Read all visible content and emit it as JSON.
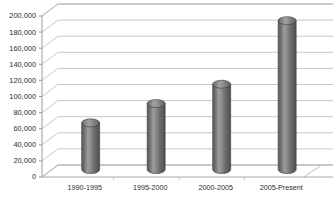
{
  "chart_data": {
    "type": "bar",
    "title": "",
    "subtitle": "",
    "xlabel": "",
    "ylabel": "",
    "categories": [
      "1990-1995",
      "1995-2000",
      "2000-2005",
      "2005-Present"
    ],
    "values": [
      58000,
      82000,
      106000,
      185000
    ],
    "series": [
      {
        "name": "",
        "values": [
          58000,
          82000,
          106000,
          185000
        ]
      }
    ],
    "ylim": [
      0,
      200000
    ],
    "ytick_step": 20000,
    "ytick_labels": [
      "0",
      "20,000",
      "40,000",
      "60,000",
      "80,000",
      "100,000",
      "120,000",
      "140,000",
      "160,000",
      "180,000",
      "200,000"
    ],
    "ytick_values": [
      0,
      20000,
      40000,
      60000,
      80000,
      100000,
      120000,
      140000,
      160000,
      180000,
      200000
    ],
    "grid": true,
    "legend": false,
    "legend_position": "none",
    "style": "3d-cylinder",
    "bar_shape": "cylinder",
    "colors": {
      "background": "#ffffff",
      "bar_fill": "#6e6e6e",
      "bar_fill_light": "#9a9a9a",
      "bar_fill_dark": "#4f4f4f",
      "bar_edge": "#3c3c3c",
      "bar_top": "#8c8c8c",
      "gridline": "#b9b9b9",
      "axis": "#8f8f8f",
      "text": "#2b2b2b",
      "floor": "#ffffff"
    }
  }
}
